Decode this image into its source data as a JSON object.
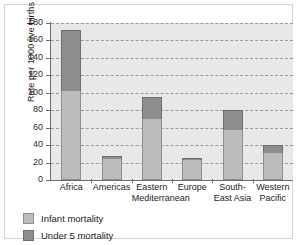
{
  "chart_data": {
    "type": "bar",
    "stacked": true,
    "title": "",
    "xlabel": "",
    "ylabel": "Rate per 1000 live births",
    "ylim": [
      0,
      180
    ],
    "ytick_step": 20,
    "yticks": [
      180,
      160,
      140,
      120,
      100,
      80,
      60,
      40,
      20,
      0
    ],
    "grid": true,
    "grid_style": "dashed-horizontal",
    "legend_position": "below-axes-left",
    "categories": [
      "Africa",
      "Americas",
      "Eastern Mediterranean",
      "Europe",
      "South-East Asia",
      "Western Pacific"
    ],
    "category_lines": [
      [
        "Africa",
        ""
      ],
      [
        "Americas",
        ""
      ],
      [
        "Eastern",
        "Mediterranean"
      ],
      [
        "Europe",
        ""
      ],
      [
        "South-",
        "East Asia"
      ],
      [
        "Western",
        "Pacific"
      ]
    ],
    "series": [
      {
        "name": "Infant mortality",
        "color": "#bcbcbc",
        "values": [
          102,
          24,
          70,
          23,
          57,
          31
        ]
      },
      {
        "name": "Under 5 mortality",
        "color": "#8d8d8d",
        "values": [
          172,
          28,
          95,
          25,
          80,
          40
        ],
        "note": "values are cumulative stack tops (total under-5 rate)"
      }
    ],
    "totals": [
      172,
      28,
      95,
      25,
      80,
      40
    ]
  },
  "legend": {
    "items": [
      {
        "label": "Infant mortality",
        "color": "#bcbcbc"
      },
      {
        "label": "Under 5 mortality",
        "color": "#8d8d8d"
      }
    ]
  },
  "colors": {
    "plot_background": "#e8e8e8",
    "gridline": "#9a9a9a",
    "axis": "#6d6d6d",
    "frame_border": "#d2d2d2",
    "infant": "#bcbcbc",
    "under5": "#8d8d8d",
    "text": "#1d1d1d"
  }
}
